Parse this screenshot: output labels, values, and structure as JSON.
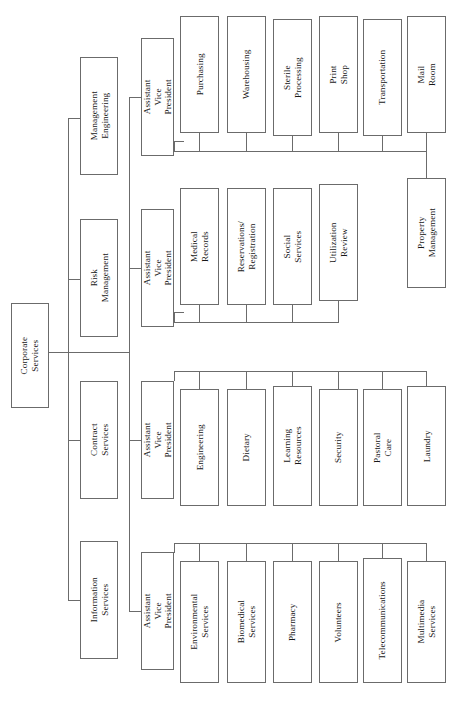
{
  "diagram": {
    "orientation": "left-to-right, rotated vertical text",
    "line_color": "#6b6b6b",
    "box_fill": "#ffffff"
  },
  "root": {
    "label": "Corporate\nServices"
  },
  "tier2": [
    {
      "label": "Management\nEngineering"
    },
    {
      "label": "Risk\nManagement"
    },
    {
      "label": "Contract\nServices"
    },
    {
      "label": "Information\nServices"
    }
  ],
  "avp": [
    {
      "label": "Assistant\nVice President"
    },
    {
      "label": "Assistant\nVice President"
    },
    {
      "label": "Assistant\nVice President"
    },
    {
      "label": "Assistant\nVice President"
    }
  ],
  "groups": [
    {
      "name": "group-1",
      "leaves": [
        {
          "label": "Purchasing"
        },
        {
          "label": "Warehousing"
        },
        {
          "label": "Sterile\nProcessing"
        },
        {
          "label": "Print Shop"
        },
        {
          "label": "Transportation"
        },
        {
          "label": "Mail Room"
        }
      ]
    },
    {
      "name": "group-2",
      "leaves": [
        {
          "label": "Medical Records"
        },
        {
          "label": "Reservations/\nRegistration"
        },
        {
          "label": "Social Services"
        },
        {
          "label": "Utilization Review"
        }
      ]
    },
    {
      "name": "group-3",
      "leaves": [
        {
          "label": "Engineering"
        },
        {
          "label": "Dietary"
        },
        {
          "label": "Learning\nResources"
        },
        {
          "label": "Security"
        },
        {
          "label": "Pastoral Care"
        },
        {
          "label": "Laundry"
        }
      ]
    },
    {
      "name": "group-4",
      "leaves": [
        {
          "label": "Environmental\nServices"
        },
        {
          "label": "Biomedical\nServices"
        },
        {
          "label": "Pharmacy"
        },
        {
          "label": "Volunteers"
        },
        {
          "label": "Telecommunications"
        },
        {
          "label": "Multimedia\nServices"
        }
      ]
    }
  ],
  "standalone": {
    "property_management": {
      "label": "Property\nManagement"
    }
  }
}
